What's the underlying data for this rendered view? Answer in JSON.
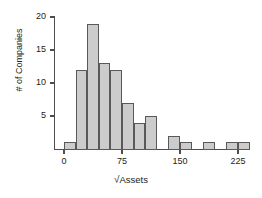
{
  "chart_data": {
    "type": "bar",
    "title": "",
    "xlabel": "√Assets",
    "ylabel": "# of Companies",
    "xlim": [
      -8,
      245
    ],
    "ylim": [
      0,
      20
    ],
    "grid": false,
    "legend": null,
    "bin_width": 15,
    "x_ticks": [
      0,
      75,
      150,
      225
    ],
    "x_tick_labels": [
      "0",
      "75",
      "150",
      "225"
    ],
    "y_ticks": [
      5,
      10,
      15,
      20
    ],
    "y_tick_labels": [
      "5",
      "10",
      "15",
      "20"
    ],
    "bin_starts": [
      0,
      15,
      30,
      45,
      60,
      75,
      90,
      105,
      120,
      135,
      150,
      165,
      180,
      195,
      210,
      225
    ],
    "values": [
      1,
      12,
      19,
      13,
      12,
      7,
      4,
      5,
      0,
      2,
      1,
      0,
      1,
      0,
      1,
      1
    ],
    "categories": [
      "0-15",
      "15-30",
      "30-45",
      "45-60",
      "60-75",
      "75-90",
      "90-105",
      "105-120",
      "120-135",
      "135-150",
      "150-165",
      "165-180",
      "180-195",
      "195-210",
      "210-225",
      "225-240"
    ],
    "bar_fill_color": "#cccccc",
    "bar_edge_color": "#595959",
    "axis_color": "#4d4d4d"
  },
  "axis": {
    "y_label": "# of Companies",
    "x_label_radical": "√",
    "x_label_text": "Assets"
  }
}
